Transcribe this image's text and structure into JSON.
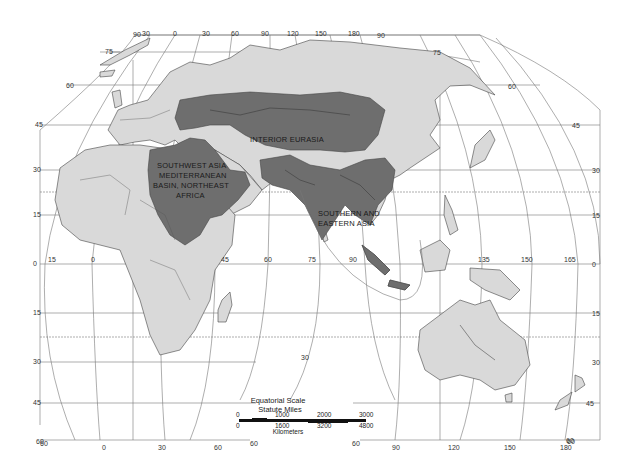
{
  "map": {
    "projection": "interrupted world map (Eastern Hemisphere)",
    "colors": {
      "background": "#ffffff",
      "land": "#d9d9d9",
      "highlighted_region": "#6e6e6e",
      "graticule": "#777777",
      "outline": "#444444"
    },
    "regions": [
      {
        "id": "interior-eurasia",
        "label": "INTERIOR EURASIA"
      },
      {
        "id": "southwest-asia",
        "label_lines": [
          "SOUTHWEST ASIA",
          "MEDITERRANEAN",
          "BASIN, NORTHEAST",
          "AFRICA"
        ]
      },
      {
        "id": "southern-eastern-asia",
        "label_lines": [
          "SOUTHERN AND",
          "EASTERN ASIA"
        ]
      }
    ],
    "graticule_labels": {
      "top_longitudes": [
        "90",
        "30",
        "0",
        "30",
        "60",
        "90",
        "120",
        "150",
        "180",
        "90"
      ],
      "equator_longitudes": [
        "15",
        "0",
        "45",
        "60",
        "75",
        "90",
        "135",
        "150",
        "165"
      ],
      "bottom_longitudes": [
        "60",
        "0",
        "30",
        "60",
        "60",
        "60",
        "90",
        "120",
        "150",
        "180",
        "60"
      ],
      "left_latitudes": [
        "75",
        "60",
        "45",
        "30",
        "15",
        "0",
        "15",
        "30",
        "45",
        "60"
      ],
      "right_latitudes": [
        "75",
        "60",
        "45",
        "30",
        "15",
        "0",
        "15",
        "30",
        "45",
        "60"
      ],
      "interior": [
        "30"
      ]
    },
    "scale": {
      "title": "Equatorial Scale",
      "miles_label": "Statute Miles",
      "miles_ticks": [
        "0",
        "1000",
        "2000",
        "3000"
      ],
      "km_ticks": [
        "0",
        "1600",
        "3200",
        "4800"
      ],
      "km_label": "Kilometers"
    }
  }
}
